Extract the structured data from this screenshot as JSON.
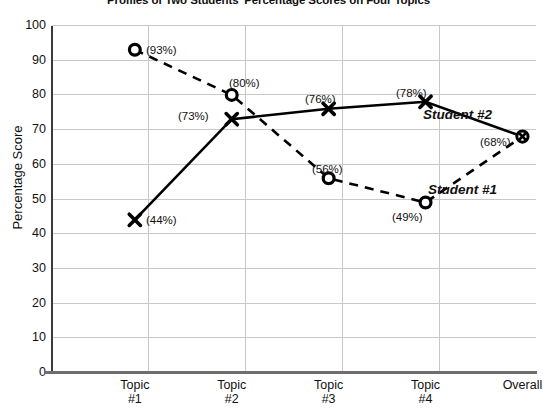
{
  "chart_data": {
    "type": "line",
    "title": "Profiles of Two Students' Percentage Scores on Four Topics",
    "xlabel": "",
    "ylabel": "Percentage Score",
    "categories": [
      "Topic\n#1",
      "Topic\n#2",
      "Topic\n#3",
      "Topic\n#4",
      "Overall"
    ],
    "category_lines": [
      {
        "line1": "Topic",
        "line2": "#1"
      },
      {
        "line1": "Topic",
        "line2": "#2"
      },
      {
        "line1": "Topic",
        "line2": "#3"
      },
      {
        "line1": "Topic",
        "line2": "#4"
      },
      {
        "line1": "Overall",
        "line2": ""
      }
    ],
    "ylim": [
      0,
      100
    ],
    "ytick_labels": [
      "100",
      "90",
      "80",
      "70",
      "60",
      "50",
      "40",
      "30",
      "20",
      "10",
      "0"
    ],
    "ytick_values": [
      100,
      90,
      80,
      70,
      60,
      50,
      40,
      30,
      20,
      10,
      0
    ],
    "grid": true,
    "legend_position": "inline",
    "series": [
      {
        "name": "Student #1",
        "marker": "open-circle",
        "line_style": "dashed",
        "color": "#000000",
        "values": [
          93,
          80,
          56,
          49,
          68
        ],
        "point_labels": [
          "(93%)",
          "(80%)",
          "(56%)",
          "(49%)",
          "(68%)"
        ]
      },
      {
        "name": "Student #2",
        "marker": "x",
        "line_style": "solid",
        "color": "#000000",
        "values": [
          44,
          73,
          76,
          78,
          68
        ],
        "point_labels": [
          "(44%)",
          "(73%)",
          "(76%)",
          "(78%)",
          ""
        ]
      }
    ],
    "annotations": [
      {
        "text": "Student #2",
        "x": 423,
        "y": 108
      },
      {
        "text": "Student #1",
        "x": 428,
        "y": 183
      }
    ],
    "point_label_positions": [
      {
        "series": "Student #1",
        "index": 0,
        "text": "(93%)",
        "x": 146,
        "y": 45
      },
      {
        "series": "Student #1",
        "index": 1,
        "text": "(80%)",
        "x": 229,
        "y": 78
      },
      {
        "series": "Student #1",
        "index": 2,
        "text": "(56%)",
        "x": 312,
        "y": 164
      },
      {
        "series": "Student #1",
        "index": 3,
        "text": "(49%)",
        "x": 392,
        "y": 212
      },
      {
        "series": "Student #1",
        "index": 4,
        "text": "(68%)",
        "x": 480,
        "y": 137
      },
      {
        "series": "Student #2",
        "index": 0,
        "text": "(44%)",
        "x": 146,
        "y": 215
      },
      {
        "series": "Student #2",
        "index": 1,
        "text": "(73%)",
        "x": 178,
        "y": 111
      },
      {
        "series": "Student #2",
        "index": 2,
        "text": "(76%)",
        "x": 305,
        "y": 94
      },
      {
        "series": "Student #2",
        "index": 3,
        "text": "(78%)",
        "x": 396,
        "y": 88
      }
    ],
    "colors": {
      "ink": "#000000",
      "grid": "#c8c8c8",
      "axis": "#3a3a3a",
      "background": "#ffffff"
    }
  }
}
